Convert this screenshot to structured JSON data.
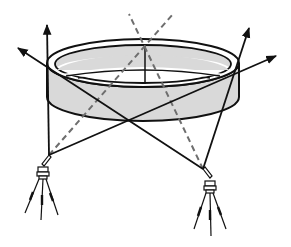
{
  "diagram": {
    "type": "technical-line-drawing",
    "colors": {
      "background": "#ffffff",
      "line": "#111111",
      "ring_fill": "#d9d9d9",
      "dashed_line": "#6e6e6e"
    },
    "elements": {
      "ring": {
        "outer_top": {
          "cx": 143,
          "cy": 63,
          "rx": 96,
          "ry": 24
        },
        "inner_top": {
          "cx": 143,
          "cy": 64,
          "rx": 88,
          "ry": 19
        },
        "band_height": 34
      },
      "theodolites": [
        {
          "name": "left",
          "apex": [
            49,
            155
          ],
          "base_y": 220
        },
        {
          "name": "right",
          "apex": [
            203,
            169
          ],
          "base_y": 235
        }
      ],
      "sight_lines": [
        {
          "from": [
            49,
            155
          ],
          "to": [
            47,
            24
          ],
          "arrow": true
        },
        {
          "from": [
            203,
            169
          ],
          "to": [
            249,
            27
          ],
          "arrow": true
        },
        {
          "from": [
            49,
            155
          ],
          "to": [
            277,
            55
          ],
          "arrow": true
        },
        {
          "from": [
            203,
            169
          ],
          "to": [
            17,
            48
          ],
          "arrow": true
        }
      ],
      "dashed_lines": [
        {
          "from": [
            49,
            155
          ],
          "to": [
            173,
            14
          ]
        },
        {
          "from": [
            203,
            169
          ],
          "to": [
            129,
            14
          ]
        }
      ],
      "center_mast": {
        "from": [
          145,
          46
        ],
        "to": [
          145,
          84
        ]
      }
    }
  }
}
